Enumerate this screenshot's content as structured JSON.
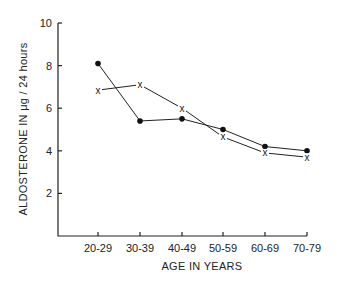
{
  "chart_data": {
    "type": "line",
    "title": "",
    "xlabel": "AGE IN YEARS",
    "ylabel": "ALDOSTERONE IN μg / 24 hours",
    "categories": [
      "20-29",
      "30-39",
      "40-49",
      "50-59",
      "60-69",
      "70-79"
    ],
    "ylim": [
      0,
      10
    ],
    "yticks": [
      2,
      4,
      6,
      8,
      10
    ],
    "grid": false,
    "legend": "none",
    "series": [
      {
        "name": "dots",
        "marker": "filled-circle",
        "values": [
          8.1,
          5.4,
          5.5,
          5.0,
          4.2,
          4.0
        ]
      },
      {
        "name": "crosses",
        "marker": "x",
        "values": [
          6.85,
          7.1,
          6.0,
          4.65,
          3.9,
          3.7
        ]
      }
    ]
  },
  "colors": {
    "ink": "#222222",
    "background": "#ffffff"
  }
}
